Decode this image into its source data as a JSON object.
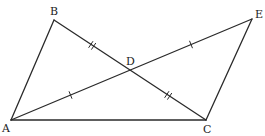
{
  "diagram": {
    "type": "geometry",
    "points": {
      "A": {
        "label": "A",
        "x": 11,
        "y": 120,
        "label_x": 2,
        "label_y": 132
      },
      "B": {
        "label": "B",
        "x": 54,
        "y": 20,
        "label_x": 50,
        "label_y": 15
      },
      "C": {
        "label": "C",
        "x": 206,
        "y": 120,
        "label_x": 203,
        "label_y": 133
      },
      "D": {
        "label": "D",
        "x": 130,
        "y": 70,
        "label_x": 126,
        "label_y": 65
      },
      "E": {
        "label": "E",
        "x": 252,
        "y": 19,
        "label_x": 255,
        "label_y": 18
      }
    },
    "segments": [
      "AB",
      "BC",
      "AC",
      "AE",
      "CE"
    ],
    "equal_marks": [
      {
        "segment": "BD",
        "ticks": 2
      },
      {
        "segment": "DC",
        "ticks": 2
      },
      {
        "segment": "AD",
        "ticks": 1
      },
      {
        "segment": "DE",
        "ticks": 1
      }
    ],
    "stroke_color": "#2a2a2a"
  }
}
